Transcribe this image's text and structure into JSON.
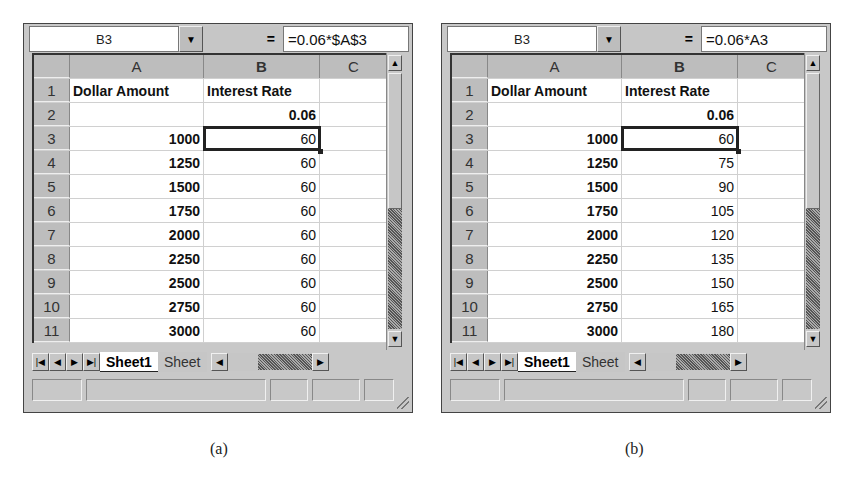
{
  "panels": [
    {
      "id": "a",
      "name_box": "B3",
      "equals_label": "=",
      "formula": "=0.06*$A$3",
      "columns": [
        "A",
        "B",
        "C"
      ],
      "rows": [
        {
          "n": "1",
          "a": "Dollar Amount",
          "b": "Interest Rate",
          "c": ""
        },
        {
          "n": "2",
          "a": "",
          "b": "0.06",
          "c": ""
        },
        {
          "n": "3",
          "a": "1000",
          "b": "60",
          "c": ""
        },
        {
          "n": "4",
          "a": "1250",
          "b": "60",
          "c": ""
        },
        {
          "n": "5",
          "a": "1500",
          "b": "60",
          "c": ""
        },
        {
          "n": "6",
          "a": "1750",
          "b": "60",
          "c": ""
        },
        {
          "n": "7",
          "a": "2000",
          "b": "60",
          "c": ""
        },
        {
          "n": "8",
          "a": "2250",
          "b": "60",
          "c": ""
        },
        {
          "n": "9",
          "a": "2500",
          "b": "60",
          "c": ""
        },
        {
          "n": "10",
          "a": "2750",
          "b": "60",
          "c": ""
        },
        {
          "n": "11",
          "a": "3000",
          "b": "60",
          "c": ""
        }
      ],
      "selected_cell": "B3",
      "tabs": {
        "active": "Sheet1",
        "inactive": "Sheet"
      },
      "caption": "(a)"
    },
    {
      "id": "b",
      "name_box": "B3",
      "equals_label": "=",
      "formula": "=0.06*A3",
      "columns": [
        "A",
        "B",
        "C"
      ],
      "rows": [
        {
          "n": "1",
          "a": "Dollar Amount",
          "b": "Interest Rate",
          "c": ""
        },
        {
          "n": "2",
          "a": "",
          "b": "0.06",
          "c": ""
        },
        {
          "n": "3",
          "a": "1000",
          "b": "60",
          "c": ""
        },
        {
          "n": "4",
          "a": "1250",
          "b": "75",
          "c": ""
        },
        {
          "n": "5",
          "a": "1500",
          "b": "90",
          "c": ""
        },
        {
          "n": "6",
          "a": "1750",
          "b": "105",
          "c": ""
        },
        {
          "n": "7",
          "a": "2000",
          "b": "120",
          "c": ""
        },
        {
          "n": "8",
          "a": "2250",
          "b": "135",
          "c": ""
        },
        {
          "n": "9",
          "a": "2500",
          "b": "150",
          "c": ""
        },
        {
          "n": "10",
          "a": "2750",
          "b": "165",
          "c": ""
        },
        {
          "n": "11",
          "a": "3000",
          "b": "180",
          "c": ""
        }
      ],
      "selected_cell": "B3",
      "tabs": {
        "active": "Sheet1",
        "inactive": "Sheet"
      },
      "caption": "(b)"
    }
  ],
  "icons": {
    "dropdown": "▼",
    "scroll_up": "▲",
    "scroll_down": "▼",
    "first": "|◀",
    "prev": "◀",
    "next": "▶",
    "last": "▶|",
    "h_left": "◀",
    "h_right": "▶"
  }
}
